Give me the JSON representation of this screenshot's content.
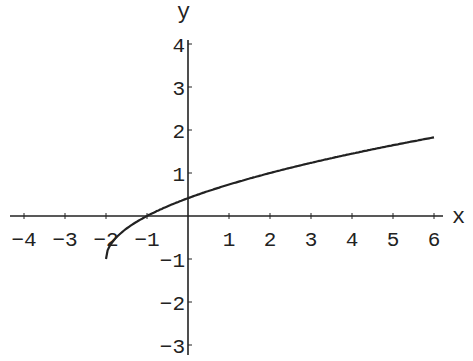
{
  "chart_data": {
    "type": "line",
    "title": "",
    "xlabel": "x",
    "ylabel": "y",
    "xlim": [
      -4,
      6
    ],
    "ylim": [
      -3,
      4
    ],
    "grid": false,
    "x_ticks": [
      "-4",
      "-3",
      "-2",
      "-1",
      "1",
      "2",
      "3",
      "4",
      "5",
      "6"
    ],
    "y_ticks": [
      "4",
      "3",
      "2",
      "1",
      "-1",
      "-2",
      "-3"
    ],
    "series": [
      {
        "name": "y = sqrt(x+2) - 1",
        "x": [
          -2,
          -1.9,
          -1.75,
          -1.5,
          -1,
          0,
          1,
          2,
          3,
          4,
          5,
          6
        ],
        "values": [
          -1,
          -0.68,
          -0.5,
          -0.29,
          0,
          0.41,
          0.73,
          1,
          1.24,
          1.45,
          1.65,
          1.83
        ]
      }
    ]
  }
}
